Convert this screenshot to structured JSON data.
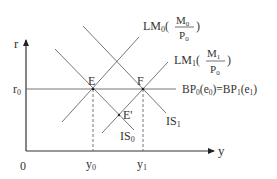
{
  "diagram": {
    "axes": {
      "y_label": "r",
      "x_label": "y",
      "origin_label": "0",
      "r0_label": "r",
      "r0_sub": "0",
      "y0_label": "y",
      "y0_sub": "0",
      "y1_label": "y",
      "y1_sub": "1"
    },
    "curves": {
      "lm0": {
        "name": "LM",
        "sub": "0",
        "num": "M",
        "num_sub": "0",
        "den": "P",
        "den_sub": "0"
      },
      "lm1": {
        "name": "LM",
        "sub": "1",
        "num": "M",
        "num_sub": "1",
        "den": "P",
        "den_sub": "0"
      },
      "bp": {
        "text_a": "BP",
        "sub_a": "0",
        "arg_a": "(e",
        "arg_a_sub": "0",
        "close_a": ")=BP",
        "sub_b": "1",
        "arg_b": "(e",
        "arg_b_sub": "1",
        "close_b": ")"
      },
      "is0": {
        "name": "IS",
        "sub": "0"
      },
      "is1": {
        "name": "IS",
        "sub": "1"
      }
    },
    "points": {
      "e": "E",
      "f": "F",
      "e_prime": "E'"
    },
    "colors": {
      "line": "#555555",
      "axis": "#333333"
    }
  }
}
